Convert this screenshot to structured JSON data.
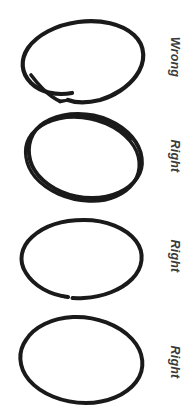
{
  "page": {
    "background_color": "#ffffff",
    "stroke_color": "#1a1a1a",
    "label_color": "#3a3a3a",
    "width": 194,
    "height": 417
  },
  "rows": [
    {
      "index": 1,
      "label": "Wrong",
      "icon_name": "open-ellipse-sketch",
      "description": "Tilted ellipse drawn as a single open loop with an unclosed gap and overshooting tail at the lower left",
      "closed": false,
      "stroke_passes": 1
    },
    {
      "index": 2,
      "label": "Right",
      "icon_name": "double-stroke-ellipse-sketch",
      "description": "Tilted ellipse traced twice so two nearly parallel strokes overlap all the way around",
      "closed": true,
      "stroke_passes": 2
    },
    {
      "index": 3,
      "label": "Right",
      "icon_name": "nearly-closed-ellipse-sketch",
      "description": "Tilted ellipse drawn in one pass, closing with only a hairline gap at the bottom",
      "closed": false,
      "stroke_passes": 1
    },
    {
      "index": 4,
      "label": "Right",
      "icon_name": "closed-ellipse-sketch",
      "description": "Tilted ellipse drawn as one clean fully closed loop",
      "closed": true,
      "stroke_passes": 1
    }
  ]
}
